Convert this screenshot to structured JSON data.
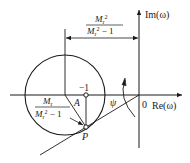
{
  "diagram": {
    "axes": {
      "real_label": "Re(ω)",
      "imag_label": "Im(ω)",
      "origin_label": "0"
    },
    "points": {
      "minus_one_label": "−1",
      "P_label": "P",
      "A_label": "A"
    },
    "angle_label": "ψ",
    "center_distance": {
      "numerator_M": "M",
      "numerator_sub": "r",
      "numerator_sup": "2",
      "denominator_M": "M",
      "denominator_sub": "r",
      "denominator_sup": "2",
      "denominator_rest": " − 1"
    },
    "radius": {
      "numerator_M": "M",
      "numerator_sub": "r",
      "denominator_M": "M",
      "denominator_sub": "r",
      "denominator_sup": "2",
      "denominator_rest": " − 1"
    },
    "colors": {
      "stroke": "#1a1a1a",
      "background": "#ffffff"
    }
  }
}
